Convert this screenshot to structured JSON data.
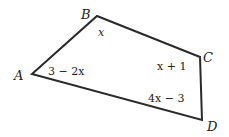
{
  "figure": {
    "shape": "quadrilateral",
    "vertices": [
      {
        "name": "A",
        "x": 32,
        "y": 74
      },
      {
        "name": "B",
        "x": 97,
        "y": 16
      },
      {
        "name": "C",
        "x": 200,
        "y": 57
      },
      {
        "name": "D",
        "x": 202,
        "y": 120
      }
    ],
    "vertex_labels": {
      "A": "A",
      "B": "B",
      "C": "C",
      "D": "D"
    },
    "angle_labels": {
      "A": "3 − 2x",
      "B": "x",
      "C": "x + 1",
      "D": "4x − 3"
    },
    "stroke_color": "#2a2a2a"
  }
}
